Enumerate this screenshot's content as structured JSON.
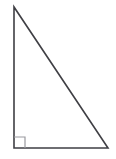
{
  "figure": {
    "name": "right-triangle",
    "canvas": {
      "width": 116,
      "height": 159,
      "background_color": "#ffffff"
    },
    "style": {
      "stroke_color": "#3f3f44",
      "stroke_width": 1.6,
      "right_angle_marker_color": "#9a9a9f",
      "right_angle_marker_width": 1.2,
      "fill": "none"
    },
    "vertices": [
      {
        "label": "top",
        "x": 14,
        "y": 7
      },
      {
        "label": "bottom-left",
        "x": 14,
        "y": 148
      },
      {
        "label": "bottom-right",
        "x": 108,
        "y": 148
      }
    ],
    "edges": [
      {
        "name": "vertical-leg",
        "from": "top",
        "to": "bottom-left"
      },
      {
        "name": "horizontal-leg",
        "from": "bottom-left",
        "to": "bottom-right"
      },
      {
        "name": "hypotenuse",
        "from": "top",
        "to": "bottom-right"
      }
    ],
    "right_angle_marker": {
      "at_vertex": "bottom-left",
      "size": 11,
      "path": "M 14 137 L 25 137 L 25 148"
    },
    "polygon_points": "14,7 14,148 108,148",
    "labels": []
  }
}
